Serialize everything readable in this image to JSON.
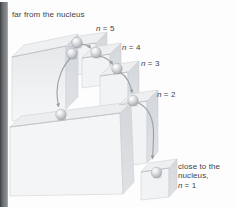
{
  "figure": {
    "caption_top": "far from the nucleus",
    "level_labels": [
      {
        "symbol": "n",
        "rest": "= 5"
      },
      {
        "symbol": "n",
        "rest": "= 4"
      },
      {
        "symbol": "n",
        "rest": "= 3"
      },
      {
        "symbol": "n",
        "rest": "= 2"
      }
    ],
    "caption_bottom": {
      "line1": "close to the",
      "line2": "nucleus,",
      "line3_symbol": "n",
      "line3_rest": "= 1"
    },
    "levels_depicted": [
      "n=5",
      "n=4",
      "n=3",
      "n=2",
      "n=1"
    ],
    "transitions_depicted": [
      "n=5 to n=4",
      "n=4 to n=3",
      "n=3 to n=2",
      "n=2 to n=1",
      "multi-level drop from top step to lower landing"
    ],
    "colors": {
      "background": "#ffffff",
      "page_edge_stripe": "#606366",
      "block_top": "#edeff0",
      "block_front": "#f2f3f5",
      "block_side": "#d8dbde",
      "edge_line": "#c2c6ca",
      "arrow": "#98a0a6",
      "text": "#3f4347"
    }
  }
}
